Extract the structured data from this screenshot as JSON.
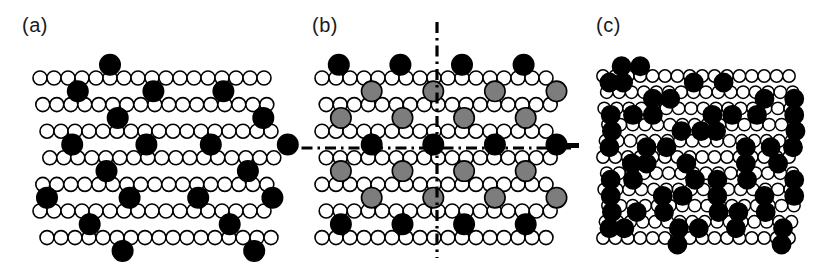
{
  "figure": {
    "type": "scientific-diagram",
    "background": "#ffffff",
    "width": 832,
    "height": 265
  },
  "legend_colors": {
    "substrate_open": "#ffffff",
    "substrate_outline": "#000000",
    "adsorbate_black": "#000000",
    "adsorbate_gray": "#7d7d7d",
    "axis": "#000000"
  },
  "panels": [
    {
      "id": "a",
      "label": "(a)",
      "label_x": 22,
      "label_y": 14,
      "lattice": {
        "origin_x": 40,
        "origin_y": 78,
        "columns": 17,
        "rows": 7,
        "atom_radius": 7.0,
        "atom_stroke": 1.6,
        "col_spacing": 14.0,
        "row_spacing": 26.6,
        "row_offsets": [
          0,
          2,
          5,
          7,
          2,
          0,
          5
        ]
      },
      "adsorbates": {
        "radius": 10.2,
        "color": "#000000",
        "positions": [
          {
            "col": 5.0,
            "row": -0.5
          },
          {
            "col": 2.6,
            "row": 0.5
          },
          {
            "col": 8.0,
            "row": 0.5
          },
          {
            "col": 13.0,
            "row": 0.5
          },
          {
            "col": 5.2,
            "row": 1.5
          },
          {
            "col": 15.6,
            "row": 1.5
          },
          {
            "col": 1.7,
            "row": 2.5
          },
          {
            "col": 7.0,
            "row": 2.5
          },
          {
            "col": 11.6,
            "row": 2.5
          },
          {
            "col": 17.1,
            "row": 2.5
          },
          {
            "col": 4.3,
            "row": 3.5
          },
          {
            "col": 14.4,
            "row": 3.5
          },
          {
            "col": 0.4,
            "row": 4.5
          },
          {
            "col": 6.3,
            "row": 4.5
          },
          {
            "col": 11.2,
            "row": 4.5
          },
          {
            "col": 16.5,
            "row": 4.5
          },
          {
            "col": 3.3,
            "row": 5.5
          },
          {
            "col": 13.3,
            "row": 5.5
          },
          {
            "col": 5.4,
            "row": 6.5
          },
          {
            "col": 14.8,
            "row": 6.5
          }
        ]
      }
    },
    {
      "id": "b",
      "label": "(b)",
      "label_x": 312,
      "label_y": 14,
      "lattice": {
        "origin_x": 322,
        "origin_y": 78,
        "columns": 17,
        "rows": 7,
        "atom_radius": 7.0,
        "atom_stroke": 1.6,
        "col_spacing": 14.0,
        "row_spacing": 26.6,
        "row_offsets": [
          0,
          3,
          0,
          3,
          0,
          3,
          0
        ]
      },
      "adsorbates": {
        "black_radius": 10.2,
        "gray_radius": 10.2,
        "black_color": "#000000",
        "gray_color": "#7d7d7d",
        "black_positions": [
          {
            "col": 1.2,
            "row": -0.5
          },
          {
            "col": 5.6,
            "row": -0.5
          },
          {
            "col": 10.0,
            "row": -0.5
          },
          {
            "col": 14.4,
            "row": -0.5
          },
          {
            "col": 3.4,
            "row": 2.5
          },
          {
            "col": 7.8,
            "row": 2.5
          },
          {
            "col": 12.2,
            "row": 2.5
          },
          {
            "col": 16.6,
            "row": 2.5
          },
          {
            "col": 1.2,
            "row": 5.5
          },
          {
            "col": 5.6,
            "row": 5.5
          },
          {
            "col": 10.0,
            "row": 5.5
          },
          {
            "col": 14.4,
            "row": 5.5
          }
        ],
        "gray_positions": [
          {
            "col": 3.4,
            "row": 0.5
          },
          {
            "col": 7.8,
            "row": 0.5
          },
          {
            "col": 12.2,
            "row": 0.5
          },
          {
            "col": 16.6,
            "row": 0.5
          },
          {
            "col": 1.2,
            "row": 1.5
          },
          {
            "col": 5.6,
            "row": 1.5
          },
          {
            "col": 10.0,
            "row": 1.5
          },
          {
            "col": 14.4,
            "row": 1.5
          },
          {
            "col": 1.2,
            "row": 3.5
          },
          {
            "col": 5.6,
            "row": 3.5
          },
          {
            "col": 10.0,
            "row": 3.5
          },
          {
            "col": 14.4,
            "row": 3.5
          },
          {
            "col": 3.4,
            "row": 4.5
          },
          {
            "col": 7.8,
            "row": 4.5
          },
          {
            "col": 12.2,
            "row": 4.5
          },
          {
            "col": 16.6,
            "row": 4.5
          }
        ]
      },
      "symmetry_axes": {
        "vertical": {
          "x": 437,
          "y1": 22,
          "y2": 258
        },
        "horizontal": {
          "y": 148,
          "x1": 278,
          "x2": 576
        },
        "dash_pattern": "11 5 2.5 5",
        "stroke_width": 3.2
      }
    },
    {
      "id": "c",
      "label": "(c)",
      "label_x": 596,
      "label_y": 14,
      "lattice": {
        "origin_x": 603,
        "origin_y": 76,
        "columns": 16,
        "rows": 11,
        "atom_radius": 6.2,
        "atom_stroke": 1.5,
        "col_spacing": 12.4,
        "row_spacing": 16.2,
        "row_offsets": [
          0,
          3,
          1,
          4,
          2,
          0,
          3,
          1,
          4,
          2,
          0
        ]
      },
      "adsorbates": {
        "radius": 9.2,
        "color": "#000000",
        "positions": [
          {
            "col": 1.5,
            "row": -0.6
          },
          {
            "col": 3.0,
            "row": -0.6
          },
          {
            "col": 0.4,
            "row": 0.4
          },
          {
            "col": 1.5,
            "row": 0.4
          },
          {
            "col": 7.2,
            "row": 0.4
          },
          {
            "col": 9.6,
            "row": 0.4
          },
          {
            "col": 3.8,
            "row": 1.4
          },
          {
            "col": 5.2,
            "row": 1.4
          },
          {
            "col": 12.8,
            "row": 1.4
          },
          {
            "col": 15.2,
            "row": 1.4
          },
          {
            "col": 0.4,
            "row": 2.4
          },
          {
            "col": 2.2,
            "row": 2.4
          },
          {
            "col": 3.8,
            "row": 2.4
          },
          {
            "col": 8.6,
            "row": 2.4
          },
          {
            "col": 10.2,
            "row": 2.4
          },
          {
            "col": 12.2,
            "row": 2.4
          },
          {
            "col": 15.2,
            "row": 2.4
          },
          {
            "col": 0.4,
            "row": 3.4
          },
          {
            "col": 6.0,
            "row": 3.4
          },
          {
            "col": 7.6,
            "row": 3.4
          },
          {
            "col": 8.8,
            "row": 3.4
          },
          {
            "col": 15.2,
            "row": 3.4
          },
          {
            "col": 0.4,
            "row": 4.4
          },
          {
            "col": 3.4,
            "row": 4.4
          },
          {
            "col": 5.0,
            "row": 4.4
          },
          {
            "col": 11.4,
            "row": 4.4
          },
          {
            "col": 13.4,
            "row": 4.4
          },
          {
            "col": 15.2,
            "row": 4.4
          },
          {
            "col": 2.2,
            "row": 5.4
          },
          {
            "col": 3.4,
            "row": 5.4
          },
          {
            "col": 6.6,
            "row": 5.4
          },
          {
            "col": 11.4,
            "row": 5.4
          },
          {
            "col": 14.0,
            "row": 5.4
          },
          {
            "col": 0.4,
            "row": 6.4
          },
          {
            "col": 2.2,
            "row": 6.4
          },
          {
            "col": 7.2,
            "row": 6.4
          },
          {
            "col": 9.0,
            "row": 6.4
          },
          {
            "col": 11.4,
            "row": 6.4
          },
          {
            "col": 15.2,
            "row": 6.4
          },
          {
            "col": 0.4,
            "row": 7.4
          },
          {
            "col": 4.6,
            "row": 7.4
          },
          {
            "col": 6.2,
            "row": 7.4
          },
          {
            "col": 9.0,
            "row": 7.4
          },
          {
            "col": 12.8,
            "row": 7.4
          },
          {
            "col": 15.2,
            "row": 7.4
          },
          {
            "col": 0.4,
            "row": 8.4
          },
          {
            "col": 2.4,
            "row": 8.4
          },
          {
            "col": 4.6,
            "row": 8.4
          },
          {
            "col": 9.0,
            "row": 8.4
          },
          {
            "col": 10.6,
            "row": 8.4
          },
          {
            "col": 12.8,
            "row": 8.4
          },
          {
            "col": 0.4,
            "row": 9.4
          },
          {
            "col": 1.6,
            "row": 9.4
          },
          {
            "col": 6.0,
            "row": 9.4
          },
          {
            "col": 7.6,
            "row": 9.4
          },
          {
            "col": 10.6,
            "row": 9.4
          },
          {
            "col": 14.4,
            "row": 9.4
          },
          {
            "col": 6.0,
            "row": 10.4
          },
          {
            "col": 14.4,
            "row": 10.4
          }
        ]
      },
      "stray_mark": {
        "x": 566,
        "y": 143,
        "width": 13,
        "height": 5
      }
    }
  ]
}
